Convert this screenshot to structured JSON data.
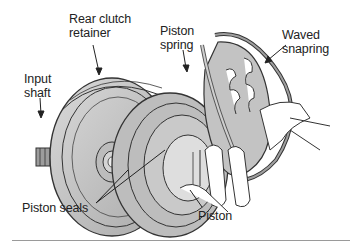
{
  "figure": {
    "labels": {
      "rear_clutch_retainer": "Rear clutch\nretainer",
      "input_shaft": "Input\nshaft",
      "piston_spring": "Piston\nspring",
      "waved_snapring": "Waved\nsnapring",
      "piston_seals": "Piston seals",
      "piston": "Piston"
    }
  },
  "colors": {
    "part_fill": "#c4c4c4",
    "part_fill_light": "#dcdcdc",
    "line": "#333333",
    "text": "#222222",
    "rule": "#9a9a9a"
  }
}
